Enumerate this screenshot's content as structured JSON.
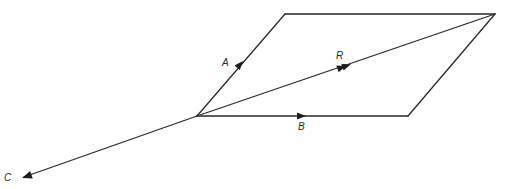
{
  "diagram": {
    "type": "vector-parallelogram",
    "stroke_color": "#2a2a2a",
    "background": "#ffffff",
    "points": {
      "origin": [
        197,
        116
      ],
      "top_left": [
        285,
        14
      ],
      "top_right": [
        495,
        14
      ],
      "bottom_right": [
        408,
        116
      ],
      "c_tip": [
        22,
        178
      ]
    },
    "vectors": [
      {
        "name": "A",
        "label": "A",
        "from": "origin",
        "to": "top_left",
        "label_pos": [
          222,
          58
        ]
      },
      {
        "name": "B",
        "label": "B",
        "from": "origin",
        "to": "bottom_right",
        "label_pos": [
          298,
          122
        ]
      },
      {
        "name": "R",
        "label": "R",
        "from": "origin",
        "to": "top_right",
        "label_pos": [
          336,
          52
        ]
      },
      {
        "name": "C",
        "label": "C",
        "from": "origin",
        "to": "c_tip",
        "label_pos": [
          4,
          173
        ]
      }
    ],
    "labels": {
      "A": "A",
      "B": "B",
      "R": "R",
      "C": "C"
    }
  }
}
